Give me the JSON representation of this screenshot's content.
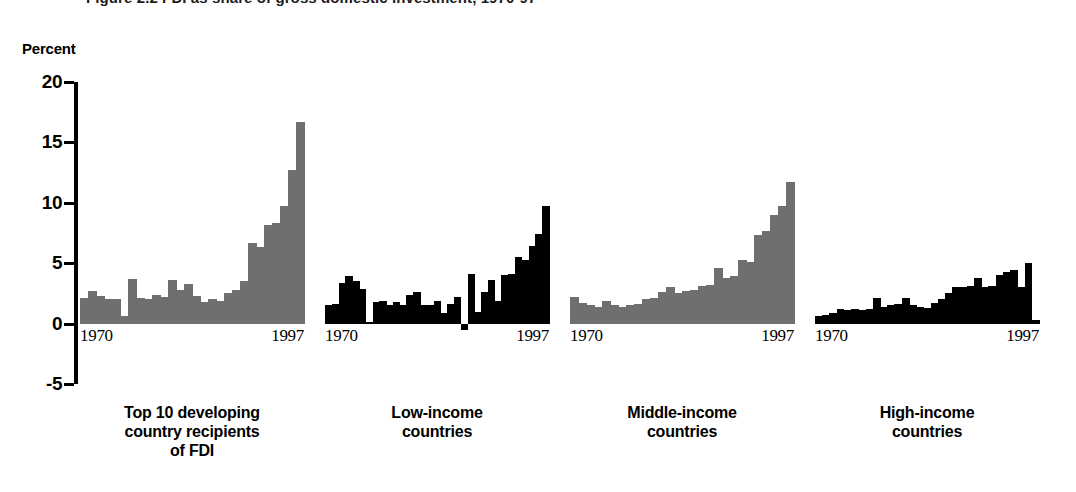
{
  "figure": {
    "title": "Figure 2.2   FDI as share of gross domestic investment, 1970-97",
    "axis_unit": "Percent"
  },
  "chart_data": {
    "type": "bar",
    "title": "Figure 2.2   FDI as share of gross domestic investment, 1970-97",
    "xlabel": "",
    "ylabel": "Percent",
    "ylim": [
      -5,
      20
    ],
    "yticks": [
      20,
      15,
      10,
      5,
      0,
      -5
    ],
    "ytick_labels": [
      "20",
      "15",
      "10",
      "5",
      "0",
      "-5"
    ],
    "grid": false,
    "legend": "none",
    "x": [
      1970,
      1971,
      1972,
      1973,
      1974,
      1975,
      1976,
      1977,
      1978,
      1979,
      1980,
      1981,
      1982,
      1983,
      1984,
      1985,
      1986,
      1987,
      1988,
      1989,
      1990,
      1991,
      1992,
      1993,
      1994,
      1995,
      1996,
      1997
    ],
    "x_tick_labels": [
      "1970",
      "1997"
    ],
    "panels": [
      {
        "name": "top-10-developing",
        "caption_lines": [
          "Top 10 developing",
          "country recipients",
          "of FDI"
        ],
        "color": "#6f6f6f",
        "values": [
          2.1,
          2.7,
          2.3,
          2.0,
          2.0,
          0.6,
          3.7,
          2.1,
          2.0,
          2.4,
          2.2,
          3.6,
          2.8,
          3.3,
          2.3,
          1.8,
          2.0,
          1.9,
          2.5,
          2.8,
          3.5,
          6.7,
          6.3,
          8.2,
          8.3,
          9.7,
          12.7,
          16.7
        ]
      },
      {
        "name": "low-income",
        "caption_lines": [
          "Low-income",
          "countries"
        ],
        "color": "#000000",
        "values": [
          1.5,
          1.6,
          3.4,
          3.9,
          3.5,
          2.9,
          0.1,
          1.8,
          1.9,
          1.5,
          1.8,
          1.5,
          2.4,
          2.6,
          1.5,
          1.5,
          1.9,
          0.9,
          1.6,
          2.2,
          -0.5,
          4.1,
          1.0,
          2.6,
          3.6,
          1.9,
          4.0,
          4.1,
          5.5,
          5.3,
          6.4,
          7.4,
          9.7
        ]
      },
      {
        "name": "middle-income",
        "caption_lines": [
          "Middle-income",
          "countries"
        ],
        "color": "#6f6f6f",
        "values": [
          2.2,
          1.7,
          1.5,
          1.4,
          1.9,
          1.5,
          1.4,
          1.5,
          1.6,
          2.0,
          2.1,
          2.6,
          3.0,
          2.5,
          2.7,
          2.8,
          3.1,
          3.2,
          4.6,
          3.8,
          3.9,
          5.3,
          5.1,
          7.3,
          7.7,
          9.0,
          9.7,
          11.7
        ]
      },
      {
        "name": "high-income",
        "caption_lines": [
          "High-income",
          "countries"
        ],
        "color": "#000000",
        "values": [
          0.6,
          0.7,
          0.9,
          1.2,
          1.1,
          1.2,
          1.1,
          1.2,
          2.1,
          1.4,
          1.5,
          1.6,
          2.1,
          1.5,
          1.4,
          1.3,
          1.7,
          2.0,
          2.5,
          3.0,
          3.0,
          3.1,
          3.8,
          3.0,
          3.1,
          4.0,
          4.3,
          4.4,
          3.0,
          5.0,
          0.3
        ]
      }
    ]
  },
  "panel_geometry": [
    {
      "left": 80,
      "width": 224
    },
    {
      "left": 325,
      "width": 224
    },
    {
      "left": 570,
      "width": 224
    },
    {
      "left": 815,
      "width": 224
    }
  ]
}
